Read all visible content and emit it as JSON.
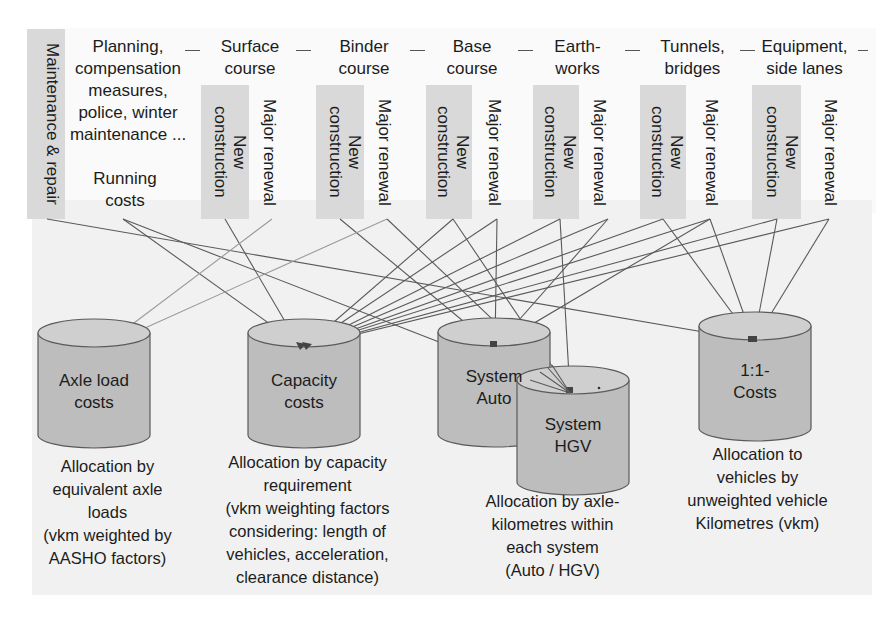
{
  "top": {
    "maintenance": "Maintenance & repair",
    "running_costs_desc": "Planning,\ncompensation\nmeasures,\npolice, winter\nmaintenance ...",
    "running_costs": "Running\ncosts",
    "categories": [
      {
        "title": "Surface\ncourse",
        "new": "New\nconstruction",
        "renewal": "Major renewal"
      },
      {
        "title": "Binder\ncourse",
        "new": "New\nconstruction",
        "renewal": "Major renewal"
      },
      {
        "title": "Base\ncourse",
        "new": "New\nconstruction",
        "renewal": "Major renewal"
      },
      {
        "title": "Earth-\nworks",
        "new": "New\nconstruction",
        "renewal": "Major renewal"
      },
      {
        "title": "Tunnels,\nbridges",
        "new": "New\nconstruction",
        "renewal": "Major renewal"
      },
      {
        "title": "Equipment,\nside lanes",
        "new": "New\nconstruction",
        "renewal": "Major renewal"
      }
    ]
  },
  "cylinders": [
    {
      "id": "axle",
      "label": "Axle load\ncosts"
    },
    {
      "id": "capacity",
      "label": "Capacity\ncosts"
    },
    {
      "id": "auto",
      "label": "System\nAuto"
    },
    {
      "id": "hgv",
      "label": "System\nHGV"
    },
    {
      "id": "oneone",
      "label": "1:1-\nCosts"
    }
  ],
  "captions": {
    "axle": "Allocation by\nequivalent axle\nloads\n(vkm weighted by\nAASHO factors)",
    "capacity": "Allocation by capacity\nrequirement\n(vkm weighting factors\nconsidering: length of\nvehicles, acceleration,\nclearance distance)",
    "system": "Allocation by axle-\nkilometres within\neach system\n(Auto / HGV)",
    "oneone": "Allocation to\nvehicles by\nunweighted vehicle\nKilometres (vkm)"
  },
  "colors": {
    "box_fill": "#d9d9d9",
    "cylinder_fill": "#bdbdbd",
    "cylinder_top": "#cfcfcf",
    "line": "#5a5a5a"
  }
}
